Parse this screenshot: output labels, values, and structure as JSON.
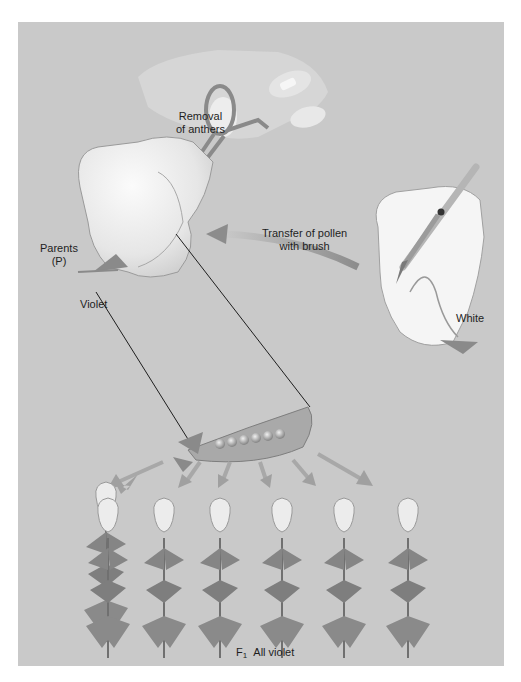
{
  "figure": {
    "colors": {
      "background": "#ffffff",
      "panel": "#c9c9c9",
      "petal": "#f2f2f2",
      "petal_shade": "#d9d9d9",
      "leaf": "#8a8a8a",
      "leaf_dark": "#6e6e6e",
      "outline": "#8f8f8f",
      "line": "#1e1e1e",
      "arrow": "#9a9a9a",
      "text": "#1e1e1e"
    }
  },
  "labels": {
    "removal": {
      "line1": "Removal",
      "line2": "of anthers"
    },
    "transfer": {
      "line1": "Transfer of pollen",
      "line2": "with brush"
    },
    "parents": {
      "line1": "Parents",
      "line2": "(P)"
    },
    "violet": "Violet",
    "white": "White",
    "f1": {
      "generation": "F",
      "subscript": "1",
      "text": "All violet"
    }
  },
  "elements": {
    "parent_violet_flower": {
      "role": "female parent",
      "color_label": "Violet"
    },
    "parent_white_flower": {
      "role": "pollen donor",
      "color_label": "White"
    },
    "tools": [
      "scissors",
      "brush",
      "hand"
    ],
    "pea_pod": {
      "seeds": 6
    },
    "offspring_arrows": 6,
    "f1_plants": {
      "count": 6,
      "phenotype": "violet"
    }
  }
}
